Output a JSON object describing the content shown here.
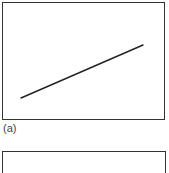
{
  "panels": [
    {
      "id": "a",
      "label": "(a)",
      "line": {
        "x1": 21,
        "y1": 98,
        "x2": 143,
        "y2": 45,
        "color": "#222222"
      }
    },
    {
      "id": "b",
      "label": ""
    }
  ],
  "colors": {
    "border": "#333333",
    "line": "#222222",
    "label": "#444444"
  }
}
